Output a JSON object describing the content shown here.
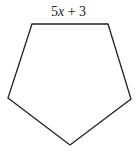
{
  "diagram": {
    "shape": "regular pentagon",
    "side_label": {
      "coefficient": "5",
      "variable": "x",
      "rest": " + 3",
      "full": "5x + 3"
    },
    "stroke_color": "#222222",
    "vertices": [
      [
        32,
        24
      ],
      [
        108,
        24
      ],
      [
        131,
        99
      ],
      [
        70,
        145
      ],
      [
        8,
        98
      ]
    ]
  }
}
